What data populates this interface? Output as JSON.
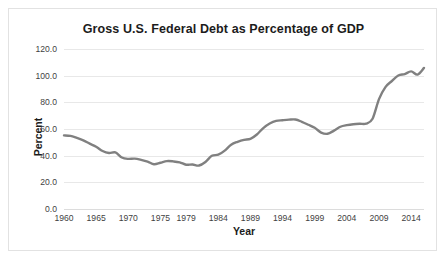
{
  "chart_data": {
    "type": "line",
    "title": "Gross U.S. Federal Debt as Percentage of GDP",
    "xlabel": "Year",
    "ylabel": "Percent",
    "ylim": [
      0,
      120
    ],
    "ytick_labels": [
      "0.0",
      "20.0",
      "40.0",
      "60.0",
      "80.0",
      "100.0",
      "120.0"
    ],
    "ytick_values": [
      0,
      20,
      40,
      60,
      80,
      100,
      120
    ],
    "xlim": [
      1960,
      2016
    ],
    "xtick_labels": [
      "1960",
      "1965",
      "1970",
      "1975",
      "1979",
      "1984",
      "1989",
      "1994",
      "1999",
      "2004",
      "2009",
      "2014"
    ],
    "xtick_values": [
      1960,
      1965,
      1970,
      1975,
      1979,
      1984,
      1989,
      1994,
      1999,
      2004,
      2009,
      2014
    ],
    "grid": "horizontal",
    "legend": "none",
    "line_color": "#808080",
    "series": [
      {
        "name": "Gross U.S. Federal Debt as Percentage of GDP",
        "x": [
          1960,
          1961,
          1962,
          1963,
          1964,
          1965,
          1966,
          1967,
          1968,
          1969,
          1970,
          1971,
          1972,
          1973,
          1974,
          1975,
          1976,
          1977,
          1978,
          1979,
          1980,
          1981,
          1982,
          1983,
          1984,
          1985,
          1986,
          1987,
          1988,
          1989,
          1990,
          1991,
          1992,
          1993,
          1994,
          1995,
          1996,
          1997,
          1998,
          1999,
          2000,
          2001,
          2002,
          2003,
          2004,
          2005,
          2006,
          2007,
          2008,
          2009,
          2010,
          2011,
          2012,
          2013,
          2014,
          2015,
          2016
        ],
        "values": [
          55.2,
          54.8,
          53.3,
          51.5,
          49.0,
          46.7,
          43.5,
          42.0,
          42.4,
          38.6,
          37.6,
          37.8,
          36.9,
          35.6,
          33.6,
          34.7,
          35.9,
          35.7,
          35.0,
          33.2,
          33.4,
          32.6,
          35.3,
          39.9,
          40.7,
          43.8,
          48.2,
          50.4,
          51.9,
          52.6,
          55.9,
          60.7,
          64.1,
          66.1,
          66.6,
          67.0,
          67.1,
          65.4,
          63.2,
          60.9,
          57.3,
          56.4,
          58.8,
          61.7,
          62.9,
          63.6,
          63.9,
          64.0,
          67.7,
          82.4,
          91.4,
          96.0,
          100.1,
          101.2,
          103.2,
          100.8,
          105.8
        ]
      }
    ],
    "annotations": []
  }
}
